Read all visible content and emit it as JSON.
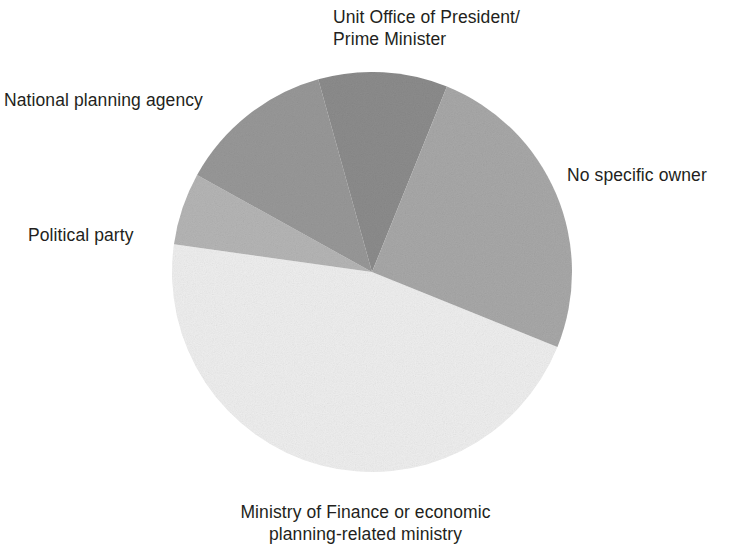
{
  "chart_data": {
    "type": "pie",
    "title": "",
    "subtitle": "",
    "xlabel": "",
    "ylabel": "",
    "legend_position": "none",
    "grid": false,
    "labels_position": "outside-callout",
    "categories": [
      "Unit Office of President/\nPrime Minister",
      "No specific owner",
      "Ministry of Finance or economic\nplanning-related ministry",
      "Political party",
      "National planning agency"
    ],
    "values": [
      10.5,
      25.0,
      46.0,
      6.0,
      14.5
    ],
    "value_unit": "percent",
    "slices": [
      {
        "label": "Unit Office of President/\nPrime Minister",
        "value": 10.5,
        "start_angle_deg": -15.6,
        "end_angle_deg": 22.0,
        "color": "#8c8c8c"
      },
      {
        "label": "No specific owner",
        "value": 25.0,
        "start_angle_deg": 22.0,
        "end_angle_deg": 112.0,
        "color": "#a8a8a8"
      },
      {
        "label": "Ministry of Finance or economic\nplanning-related ministry",
        "value": 46.0,
        "start_angle_deg": 112.0,
        "end_angle_deg": 278.0,
        "color": "#eeeeee"
      },
      {
        "label": "Political party",
        "value": 6.0,
        "start_angle_deg": 278.0,
        "end_angle_deg": 299.0,
        "color": "#b5b5b5"
      },
      {
        "label": "National planning agency",
        "value": 14.5,
        "start_angle_deg": 299.0,
        "end_angle_deg": 344.4,
        "color": "#989898"
      }
    ],
    "geometry": {
      "center_x": 372,
      "center_y": 272,
      "radius": 200
    }
  },
  "labels": {
    "unit_office": "Unit Office of President/\nPrime Minister",
    "national_planning": "National planning agency",
    "political_party": "Political party",
    "no_specific_owner": "No specific owner",
    "ministry_finance": "Ministry of Finance or economic\nplanning-related ministry"
  },
  "colors": {
    "background": "#ffffff",
    "text": "#231f20",
    "unit_office": "#8c8c8c",
    "no_specific_owner": "#a8a8a8",
    "ministry_finance": "#eeeeee",
    "political_party": "#b5b5b5",
    "national_planning": "#989898"
  }
}
